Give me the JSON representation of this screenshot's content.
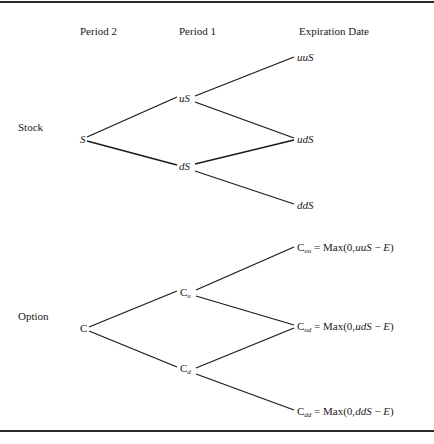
{
  "headers": {
    "col1": "Period 2",
    "col2": "Period 1",
    "col3": "Expiration Date"
  },
  "rows": {
    "stock": "Stock",
    "option": "Option"
  },
  "stock_tree": {
    "root": "S",
    "up": "uS",
    "down": "dS",
    "uu": "uuS",
    "ud": "udS",
    "dd": "ddS"
  },
  "option_tree": {
    "root": "C",
    "up": {
      "base": "C",
      "sub": "u"
    },
    "down": {
      "base": "C",
      "sub": "d"
    },
    "uu": {
      "base": "C",
      "sub": "uu",
      "eq": " = Max(0,",
      "arg": "uuS",
      "minus": " − ",
      "strike": "E",
      "close": ")"
    },
    "ud": {
      "base": "C",
      "sub": "ud",
      "eq": " = Max(0,",
      "arg": "udS",
      "minus": " − ",
      "strike": "E",
      "close": ")"
    },
    "dd": {
      "base": "C",
      "sub": "dd",
      "eq": " = Max(0,",
      "arg": "ddS",
      "minus": " − ",
      "strike": "E",
      "close": ")"
    }
  },
  "colors": {
    "line": "#1a1a1a",
    "background": "#ffffff"
  }
}
